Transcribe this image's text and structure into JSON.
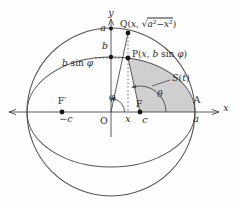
{
  "figure": {
    "colors": {
      "background": "#fefefe",
      "curve_stroke": "#555555",
      "axis_stroke": "#4a4a4a",
      "text": "#2b2b2b",
      "dot_fill": "#151515",
      "shade_fill": "#cfcfcf"
    },
    "axes": {
      "x_label": "x",
      "y_label": "y"
    },
    "ticks": {
      "a_on_y_axis": "a",
      "b_on_y_axis": "b"
    },
    "points": {
      "q_label": {
        "point": "Q",
        "lparen": "(",
        "var": "x",
        "sep": ", ",
        "sqrt": "√",
        "radicand": "a²−x²",
        "rparen": ")"
      },
      "p_label": {
        "point": "P",
        "lparen": "(",
        "var": "x",
        "sep": ", ",
        "coef": "b",
        "func": " sin ",
        "angle": "φ",
        "rparen": ")"
      },
      "origin": "O",
      "focus_right": "F",
      "focus_left": "F′",
      "vertex": "A"
    },
    "coords": {
      "x_foot": "x",
      "c_right": "c",
      "c_left": "−c",
      "a_vertex": "a"
    },
    "measures": {
      "b_sin_phi": {
        "coef": "b",
        "func": " sin ",
        "angle": "φ"
      },
      "phi": "φ",
      "theta": "θ",
      "region": {
        "s": "S",
        "lparen": "(",
        "t": "t",
        "rparen": ")"
      }
    }
  }
}
